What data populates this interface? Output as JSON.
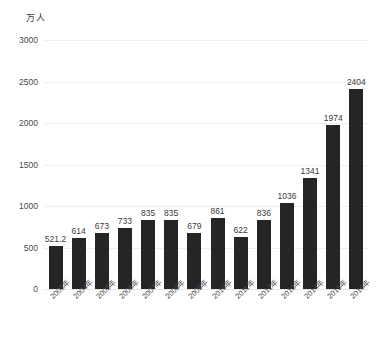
{
  "chart_data": {
    "type": "bar",
    "title": "",
    "subtitle": "",
    "xlabel": "",
    "ylabel": "万人",
    "unit_caption": "万人",
    "categories": [
      "2003年",
      "2004年",
      "2005年",
      "2006年",
      "2007年",
      "2008年",
      "2009年",
      "2010年",
      "2011年",
      "2012年",
      "2013年",
      "2014年",
      "2015年",
      "2016年"
    ],
    "values": [
      521.2,
      614,
      673,
      733,
      835,
      835,
      679,
      861,
      622,
      836,
      1036,
      1341,
      1974,
      2404
    ],
    "value_labels": [
      "521.2",
      "614",
      "673",
      "733",
      "835",
      "835",
      "679",
      "861",
      "622",
      "836",
      "1036",
      "1341",
      "1974",
      "2404"
    ],
    "ylim": [
      0,
      3000
    ],
    "yticks": [
      0,
      500,
      1000,
      1500,
      2000,
      2500,
      3000
    ],
    "ytick_labels": [
      "0",
      "500",
      "1000",
      "1500",
      "2000",
      "2500",
      "3000"
    ],
    "grid": true,
    "grid_axis": "y",
    "legend": false,
    "legend_position": "none",
    "series": [
      {
        "name": "",
        "values": [
          521.2,
          614,
          673,
          733,
          835,
          835,
          679,
          861,
          622,
          836,
          1036,
          1341,
          1974,
          2404
        ]
      }
    ],
    "colors": {
      "bar": "#252525",
      "grid": "#efefef",
      "text": "#3a3a3a",
      "background": "#ffffff"
    }
  }
}
